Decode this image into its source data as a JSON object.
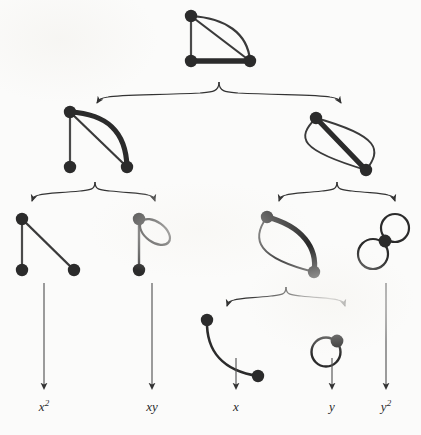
{
  "figure": {
    "background_color": "#fbfbfa",
    "ink_color": "#2b2b2b",
    "edge_thin_color": "#4a4a4a",
    "edge_thick_color": "#2b2b2b",
    "vertex_color": "#2b2b2b",
    "arrow_color": "#333333",
    "width": 421,
    "height": 435
  },
  "levels": [
    {
      "index": 0,
      "name": "root-level",
      "node_count": 1
    },
    {
      "index": 1,
      "name": "second-level",
      "node_count": 2
    },
    {
      "index": 2,
      "name": "third-level",
      "node_count": 4
    },
    {
      "index": 3,
      "name": "fourth-level",
      "node_count": 2
    }
  ],
  "graphs": [
    {
      "id": "g-root",
      "name": "root-graph",
      "description": "triangle with doubled diagonal edge",
      "vertex_count": 3,
      "edge_count": 4,
      "loops": 0
    },
    {
      "id": "g-left",
      "name": "left-branch-graph",
      "description": "path of three vertices with doubled diagonal edge",
      "vertex_count": 3,
      "edge_count": 3,
      "loops": 0
    },
    {
      "id": "g-right",
      "name": "right-branch-graph",
      "description": "two vertices joined by a triple edge",
      "vertex_count": 2,
      "edge_count": 3,
      "loops": 0
    },
    {
      "id": "g-ll",
      "name": "path-graph",
      "description": "path of three vertices, two single edges",
      "vertex_count": 3,
      "edge_count": 2,
      "loops": 0
    },
    {
      "id": "g-lr",
      "name": "edge-with-loop-graph",
      "description": "single edge with one self-loop at top vertex",
      "vertex_count": 2,
      "edge_count": 2,
      "loops": 1
    },
    {
      "id": "g-rl",
      "name": "double-edge-graph",
      "description": "two vertices joined by a double edge",
      "vertex_count": 2,
      "edge_count": 2,
      "loops": 0
    },
    {
      "id": "g-rr",
      "name": "double-loop-graph",
      "description": "single vertex carrying two self-loops",
      "vertex_count": 1,
      "edge_count": 2,
      "loops": 2
    },
    {
      "id": "g-rll",
      "name": "single-edge-graph",
      "description": "two vertices joined by one curved edge",
      "vertex_count": 2,
      "edge_count": 1,
      "loops": 0
    },
    {
      "id": "g-rlr",
      "name": "single-loop-graph",
      "description": "single vertex with one self-loop",
      "vertex_count": 1,
      "edge_count": 1,
      "loops": 1
    }
  ],
  "braces": [
    {
      "id": "brace-root",
      "name": "brace-root-split",
      "from": "g-root",
      "to": [
        "g-left",
        "g-right"
      ]
    },
    {
      "id": "brace-left",
      "name": "brace-left-split",
      "from": "g-left",
      "to": [
        "g-ll",
        "g-lr"
      ]
    },
    {
      "id": "brace-right",
      "name": "brace-right-split",
      "from": "g-right",
      "to": [
        "g-rl",
        "g-rr"
      ]
    },
    {
      "id": "brace-rl",
      "name": "brace-double-edge-split",
      "from": "g-rl",
      "to": [
        "g-rll",
        "g-rlr"
      ]
    }
  ],
  "terminal_arrows": [
    {
      "id": "arr-x2",
      "name": "arrow-to-x-squared",
      "from": "g-ll",
      "label_id": "lab-x2"
    },
    {
      "id": "arr-xy",
      "name": "arrow-to-xy",
      "from": "g-lr",
      "label_id": "lab-xy"
    },
    {
      "id": "arr-x",
      "name": "arrow-to-x",
      "from": "g-rll",
      "label_id": "lab-x"
    },
    {
      "id": "arr-y",
      "name": "arrow-to-y",
      "from": "g-rlr",
      "label_id": "lab-y"
    },
    {
      "id": "arr-y2",
      "name": "arrow-to-y-squared",
      "from": "g-rr",
      "label_id": "lab-y2"
    }
  ],
  "labels": [
    {
      "id": "lab-x2",
      "name": "label-x-squared",
      "base": "x",
      "exponent": "2",
      "text": "x2",
      "x": 44,
      "y": 404
    },
    {
      "id": "lab-xy",
      "name": "label-xy",
      "base": "xy",
      "exponent": "",
      "text": "xy",
      "x": 152,
      "y": 404
    },
    {
      "id": "lab-x",
      "name": "label-x",
      "base": "x",
      "exponent": "",
      "text": "x",
      "x": 236,
      "y": 404
    },
    {
      "id": "lab-y",
      "name": "label-y",
      "base": "y",
      "exponent": "",
      "text": "y",
      "x": 332,
      "y": 404
    },
    {
      "id": "lab-y2",
      "name": "label-y-squared",
      "base": "y",
      "exponent": "2",
      "text": "y2",
      "x": 386,
      "y": 404
    }
  ]
}
